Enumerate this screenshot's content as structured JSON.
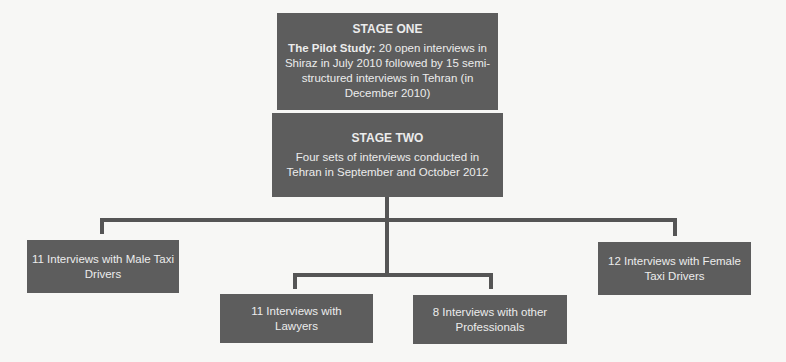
{
  "diagram": {
    "stage_one": {
      "title": "STAGE ONE",
      "lead": "The Pilot Study:",
      "text": " 20 open interviews in Shiraz in July 2010 followed by 15 semi-structured interviews in Tehran (in December 2010)"
    },
    "stage_two": {
      "title": "STAGE TWO",
      "text": "Four sets of interviews conducted in Tehran in September and October 2012"
    },
    "branches": [
      {
        "label": "11 Interviews with Male Taxi Drivers"
      },
      {
        "label": "11 Interviews with Lawyers"
      },
      {
        "label": "8 Interviews with other Professionals"
      },
      {
        "label": "12 Interviews with Female Taxi Drivers"
      }
    ],
    "colors": {
      "box_fill": "#5d5d5d",
      "box_text": "#ececec",
      "connector": "#555555",
      "background": "#f7f7f5"
    }
  }
}
